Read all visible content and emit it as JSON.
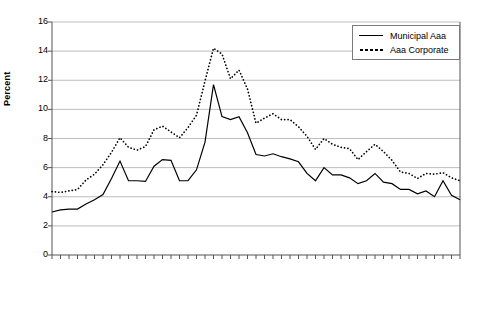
{
  "chart_data": {
    "type": "line",
    "title": "",
    "xlabel": "",
    "ylabel": "Percent",
    "ylim": [
      0,
      16
    ],
    "ytick_step": 2,
    "yticks": [
      "16",
      "14",
      "12",
      "10",
      "8",
      "6",
      "4",
      "2",
      "0"
    ],
    "grid": "horizontal",
    "legend_position": "top-right",
    "x": [
      1962,
      1963,
      1964,
      1965,
      1966,
      1967,
      1968,
      1969,
      1970,
      1971,
      1972,
      1973,
      1974,
      1975,
      1976,
      1977,
      1978,
      1979,
      1980,
      1981,
      1982,
      1983,
      1984,
      1985,
      1986,
      1987,
      1988,
      1989,
      1990,
      1991,
      1992,
      1993,
      1994,
      1995,
      1996,
      1997,
      1998,
      1999,
      2000,
      2001,
      2002,
      2003,
      2004,
      2005,
      2006,
      2007,
      2008,
      2009,
      2010
    ],
    "xtick_labels": [
      "1962",
      "1964",
      "1966",
      "1968",
      "1970",
      "1972",
      "1974",
      "1976",
      "1978",
      "1980",
      "1982",
      "1984",
      "1986",
      "1988",
      "1990",
      "1992",
      "1994",
      "1996",
      "1998",
      "2000",
      "2002",
      "2004",
      "2006",
      "2008",
      "2010*"
    ],
    "series": [
      {
        "name": "Municipal Aaa",
        "style": "solid",
        "color": "#000000",
        "values": [
          2.95,
          3.1,
          3.15,
          3.15,
          3.5,
          3.8,
          4.15,
          5.25,
          6.45,
          5.1,
          5.1,
          5.05,
          6.1,
          6.55,
          6.5,
          5.1,
          5.1,
          5.85,
          7.75,
          11.7,
          9.5,
          9.3,
          9.5,
          8.4,
          6.9,
          6.8,
          6.95,
          6.75,
          6.6,
          6.4,
          5.6,
          5.1,
          6.0,
          5.5,
          5.5,
          5.3,
          4.9,
          5.1,
          5.6,
          5.0,
          4.9,
          4.5,
          4.5,
          4.2,
          4.4,
          4.0,
          5.1,
          4.1,
          3.8
        ]
      },
      {
        "name": "Aaa Corporate",
        "style": "dotted",
        "color": "#000000",
        "values": [
          4.35,
          4.3,
          4.4,
          4.5,
          5.15,
          5.55,
          6.2,
          7.05,
          8.05,
          7.4,
          7.2,
          7.45,
          8.6,
          8.85,
          8.45,
          8.05,
          8.75,
          9.6,
          11.95,
          14.2,
          13.8,
          12.1,
          12.7,
          11.4,
          9.05,
          9.4,
          9.7,
          9.3,
          9.3,
          8.8,
          8.15,
          7.25,
          8.0,
          7.6,
          7.4,
          7.3,
          6.55,
          7.1,
          7.6,
          7.1,
          6.5,
          5.7,
          5.6,
          5.25,
          5.6,
          5.55,
          5.65,
          5.3,
          5.1
        ]
      }
    ]
  }
}
